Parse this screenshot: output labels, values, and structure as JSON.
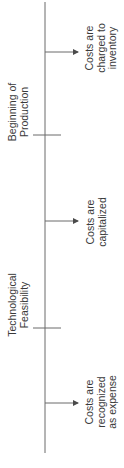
{
  "diagram": {
    "type": "vertical timeline",
    "orientation": "rotated -90deg (reads bottom-to-top)",
    "line_color": "#6b6b6b",
    "text_color": "#3a3a3a",
    "milestones": [
      {
        "line1": "Technological",
        "line2": "Feasibility"
      },
      {
        "line1": "Beginning of",
        "line2": "Production"
      }
    ],
    "phases": [
      {
        "line1": "Costs are",
        "line2": "recognized",
        "line3": "as expense"
      },
      {
        "line1": "Costs are",
        "line2": "capitalized"
      },
      {
        "line1": "Costs are",
        "line2": "charged to",
        "line3": "inventory"
      }
    ]
  }
}
